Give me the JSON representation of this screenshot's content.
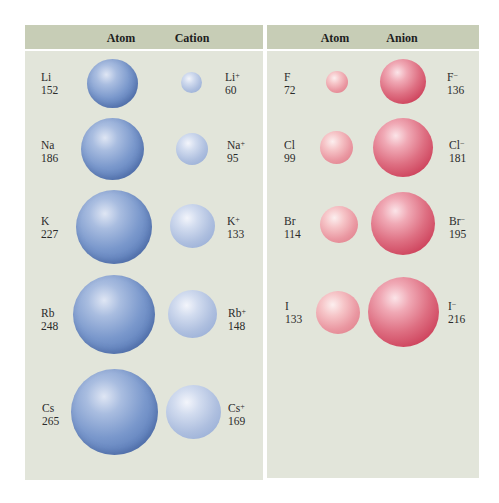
{
  "left_panel": {
    "col_headers": [
      "Atom",
      "Cation"
    ],
    "rows": [
      {
        "atom": "Li",
        "atom_radius": "152",
        "ion": "Li",
        "ion_charge": "+",
        "ion_radius": "60"
      },
      {
        "atom": "Na",
        "atom_radius": "186",
        "ion": "Na",
        "ion_charge": "+",
        "ion_radius": "95"
      },
      {
        "atom": "K",
        "atom_radius": "227",
        "ion": "K",
        "ion_charge": "+",
        "ion_radius": "133"
      },
      {
        "atom": "Rb",
        "atom_radius": "248",
        "ion": "Rb",
        "ion_charge": "+",
        "ion_radius": "148"
      },
      {
        "atom": "Cs",
        "atom_radius": "265",
        "ion": "Cs",
        "ion_charge": "+",
        "ion_radius": "169"
      }
    ]
  },
  "right_panel": {
    "col_headers": [
      "Atom",
      "Anion"
    ],
    "rows": [
      {
        "atom": "F",
        "atom_radius": "72",
        "ion": "F",
        "ion_charge": "−",
        "ion_radius": "136"
      },
      {
        "atom": "Cl",
        "atom_radius": "99",
        "ion": "Cl",
        "ion_charge": "−",
        "ion_radius": "181"
      },
      {
        "atom": "Br",
        "atom_radius": "114",
        "ion": "Br",
        "ion_charge": "−",
        "ion_radius": "195"
      },
      {
        "atom": "I",
        "atom_radius": "133",
        "ion": "I",
        "ion_charge": "−",
        "ion_radius": "216"
      }
    ]
  },
  "colors": {
    "header_bg": "#c7cdb6",
    "panel_bg": "#e2e5da",
    "atom_cation_blue": "#6f8fc7",
    "cation_light_blue": "#b3c4e3",
    "anion_red": "#cf4560",
    "atom_light_red": "#e58995"
  }
}
